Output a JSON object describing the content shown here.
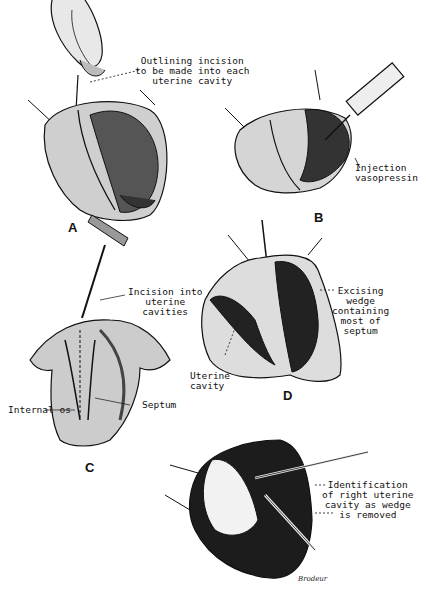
{
  "figure": {
    "panels": [
      {
        "id": "A",
        "label": "A",
        "annotations": [
          {
            "text": "Outlining incision\nto be made into each\nuterine cavity"
          }
        ]
      },
      {
        "id": "B",
        "label": "B",
        "annotations": [
          {
            "text": "Injection\nvasopressin"
          }
        ]
      },
      {
        "id": "C",
        "label": "C",
        "annotations": [
          {
            "text": "Incision into\nuterine\ncavities"
          },
          {
            "text": "Internal os"
          },
          {
            "text": "Septum"
          }
        ]
      },
      {
        "id": "D",
        "label": "D",
        "annotations": [
          {
            "text": "Excising\nwedge\ncontaining\nmost of\nseptum"
          },
          {
            "text": "Uterine\ncavity"
          }
        ]
      },
      {
        "id": "E",
        "label": "",
        "annotations": [
          {
            "text": "Identification\nof right uterine\ncavity as wedge\nis removed"
          }
        ]
      }
    ],
    "signature": "Brodeur"
  },
  "colors": {
    "ink": "#111111",
    "paper": "#ffffff",
    "shade": "#2a2a2a"
  }
}
